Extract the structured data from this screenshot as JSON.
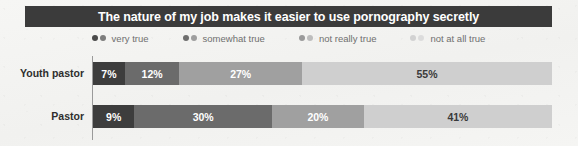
{
  "title": {
    "text": "The nature of my job makes it easier to use pornography secretly"
  },
  "legend": {
    "items": [
      {
        "label": "very true",
        "dot_dark": "#4a4a4a",
        "dot_light": "#7d7d7d"
      },
      {
        "label": "somewhat true",
        "dot_dark": "#6e6e6e",
        "dot_light": "#9e9e9e"
      },
      {
        "label": "not really true",
        "dot_dark": "#9a9a9a",
        "dot_light": "#bdbdbd"
      },
      {
        "label": "not at all true",
        "dot_dark": "#d2d2d2",
        "dot_light": "#dcdcdc"
      }
    ]
  },
  "colors": {
    "banner": "#3b3b3b",
    "seg_very_true": "#3d3d3d",
    "seg_somewhat_true": "#6b6b6b",
    "seg_not_really_true": "#a0a0a0",
    "seg_not_at_all_true": "#cfcfcf",
    "label_on_dark": "#ffffff",
    "label_on_light": "#3a3a3a",
    "axis": "#9a9a9a",
    "background": "#f4f4f2"
  },
  "chart_data": {
    "type": "bar",
    "orientation": "horizontal",
    "stacked": true,
    "title": "The nature of my job makes it easier to use pornography secretly",
    "xlabel": "",
    "ylabel": "",
    "xlim": [
      0,
      100
    ],
    "grid": false,
    "legend_position": "top",
    "categories": [
      "Youth pastor",
      "Pastor"
    ],
    "series": [
      {
        "name": "very true",
        "values": [
          7,
          9
        ]
      },
      {
        "name": "somewhat true",
        "values": [
          12,
          30
        ]
      },
      {
        "name": "not really true",
        "values": [
          27,
          20
        ]
      },
      {
        "name": "not at all true",
        "values": [
          55,
          41
        ]
      }
    ],
    "rows": [
      {
        "label": "Youth pastor",
        "segments": [
          {
            "series": "very true",
            "value": 7,
            "display": "7%",
            "color": "#3d3d3d",
            "text_color": "#ffffff"
          },
          {
            "series": "somewhat true",
            "value": 12,
            "display": "12%",
            "color": "#6b6b6b",
            "text_color": "#ffffff"
          },
          {
            "series": "not really true",
            "value": 27,
            "display": "27%",
            "color": "#a0a0a0",
            "text_color": "#ffffff"
          },
          {
            "series": "not at all true",
            "value": 55,
            "display": "55%",
            "color": "#cfcfcf",
            "text_color": "#3a3a3a"
          }
        ]
      },
      {
        "label": "Pastor",
        "segments": [
          {
            "series": "very true",
            "value": 9,
            "display": "9%",
            "color": "#3d3d3d",
            "text_color": "#ffffff"
          },
          {
            "series": "somewhat true",
            "value": 30,
            "display": "30%",
            "color": "#6b6b6b",
            "text_color": "#ffffff"
          },
          {
            "series": "not really true",
            "value": 20,
            "display": "20%",
            "color": "#a0a0a0",
            "text_color": "#ffffff"
          },
          {
            "series": "not at all true",
            "value": 41,
            "display": "41%",
            "color": "#cfcfcf",
            "text_color": "#3a3a3a"
          }
        ]
      }
    ]
  }
}
